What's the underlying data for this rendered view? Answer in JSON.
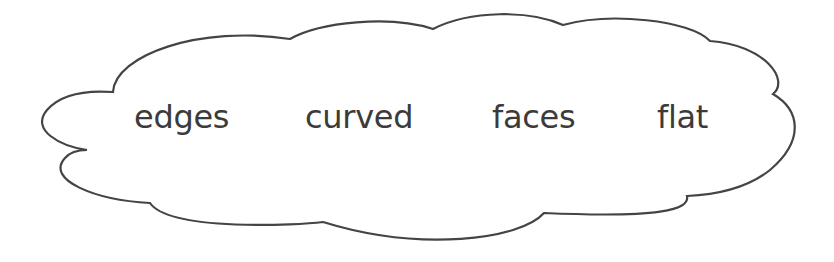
{
  "diagram": {
    "shape": "cloud",
    "stroke_color": "#444444",
    "fill_color": "#ffffff",
    "text_color": "#3b3b3b",
    "words": [
      {
        "label": "edges"
      },
      {
        "label": "curved"
      },
      {
        "label": "faces"
      },
      {
        "label": "flat"
      }
    ]
  }
}
